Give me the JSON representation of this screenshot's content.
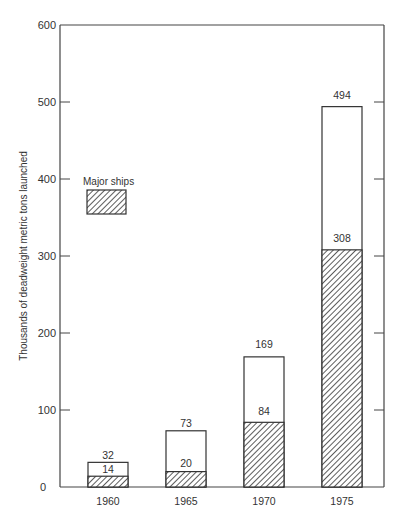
{
  "chart_data": {
    "type": "bar",
    "stacked": "overlay",
    "title": "",
    "xlabel": "",
    "ylabel": "Thousands of deadweight metric tons launched",
    "ylim": [
      0,
      600
    ],
    "yticks": [
      0,
      100,
      200,
      300,
      400,
      500,
      600
    ],
    "categories": [
      "1960",
      "1965",
      "1970",
      "1975"
    ],
    "series": [
      {
        "name": "Total",
        "values": [
          32,
          73,
          169,
          494
        ],
        "pattern": "none"
      },
      {
        "name": "Major ships",
        "values": [
          14,
          20,
          84,
          308
        ],
        "pattern": "hatched"
      }
    ],
    "legend": {
      "label": "Major ships",
      "position": "upper-left"
    },
    "grid": false
  },
  "axis": {
    "ylabel": "Thousands of deadweight metric tons launched",
    "ticks": [
      "0",
      "100",
      "200",
      "300",
      "400",
      "500",
      "600"
    ]
  },
  "legend": {
    "label": "Major ships"
  },
  "categories": [
    "1960",
    "1965",
    "1970",
    "1975"
  ],
  "totals": [
    "32",
    "73",
    "169",
    "494"
  ],
  "major": [
    "14",
    "20",
    "84",
    "308"
  ]
}
